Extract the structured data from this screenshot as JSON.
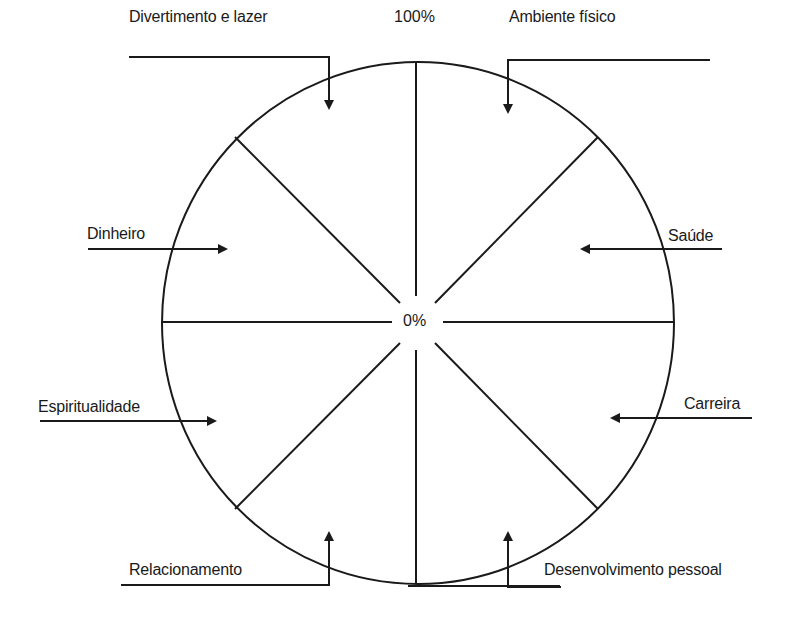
{
  "diagram": {
    "type": "wheel-of-life",
    "center_label": "0%",
    "outer_label": "100%",
    "stroke_color": "#1a1a1a",
    "background": "#ffffff",
    "segments": [
      {
        "label": "Ambiente físico"
      },
      {
        "label": "Saúde"
      },
      {
        "label": "Carreira"
      },
      {
        "label": "Desenvolvimento pessoal"
      },
      {
        "label": "Relacionamento"
      },
      {
        "label": "Espiritualidade"
      },
      {
        "label": "Dinheiro"
      },
      {
        "label": "Divertimento e lazer"
      }
    ]
  }
}
